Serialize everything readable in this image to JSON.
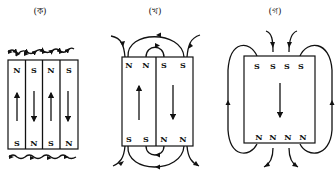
{
  "panels": [
    {
      "id": "a",
      "label": "(ক)",
      "description": "Alternating domains, closed at surface",
      "top_poles": [
        "N",
        "S",
        "N",
        "S"
      ],
      "bottom_poles": [
        "S",
        "N",
        "S",
        "N"
      ],
      "magnetization_arrows": [
        "up",
        "down",
        "up",
        "down"
      ]
    },
    {
      "id": "b",
      "label": "(খ)",
      "description": "Two domains with external field loops",
      "top_poles": [
        "N",
        "N",
        "S",
        "S"
      ],
      "bottom_poles": [
        "S",
        "S",
        "N",
        "N"
      ],
      "magnetization_arrows": [
        "up",
        "down"
      ]
    },
    {
      "id": "c",
      "label": "(গ)",
      "description": "Single domain with large external field",
      "top_poles": [
        "S",
        "S",
        "S",
        "S"
      ],
      "bottom_poles": [
        "N",
        "N",
        "N",
        "N"
      ],
      "magnetization_arrows": [
        "down"
      ]
    }
  ],
  "colors": {
    "ink": "#111111",
    "background": "#ffffff"
  }
}
